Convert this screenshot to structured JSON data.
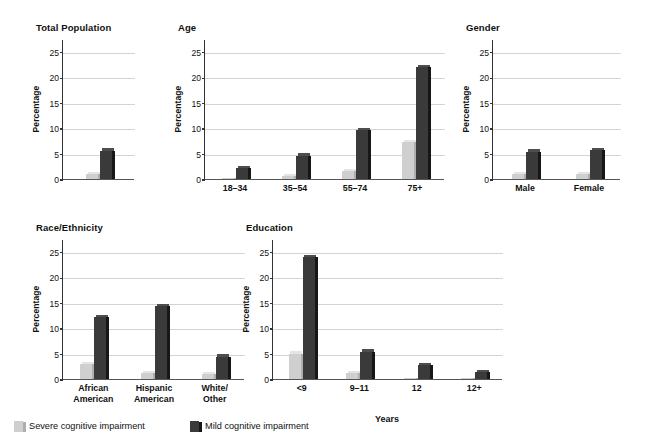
{
  "figure": {
    "ylabel": "Percentage",
    "yticks": [
      0,
      5,
      10,
      15,
      20,
      25
    ],
    "ymax": 27.5,
    "colors": {
      "severe": "#cfcfcf",
      "severe_side": "#aeaeae",
      "severe_top": "#e4e4e4",
      "mild": "#3a3a3a",
      "mild_side": "#171717",
      "mild_top": "#4e4e4e",
      "grid": "#d3d3d3",
      "axis": "#333333",
      "text": "#111111"
    }
  },
  "legend": {
    "position": "bottom-left",
    "items": [
      {
        "label": "Severe cognitive impairment",
        "key": "severe"
      },
      {
        "label": "Mild cognitive impairment",
        "key": "mild"
      }
    ]
  },
  "chart_data": [
    {
      "type": "bar",
      "title": "Total Population",
      "xlabel": "",
      "ylabel": "Percentage",
      "ylim": [
        0,
        27.5
      ],
      "yticks": [
        0,
        5,
        10,
        15,
        20,
        25
      ],
      "grid": true,
      "categories": [
        "Total Population"
      ],
      "series": [
        {
          "name": "Severe cognitive impairment",
          "values": [
            1.0
          ]
        },
        {
          "name": "Mild cognitive impairment",
          "values": [
            5.6
          ]
        }
      ]
    },
    {
      "type": "bar",
      "title": "Age",
      "xlabel": "",
      "ylabel": "Percentage",
      "ylim": [
        0,
        27.5
      ],
      "yticks": [
        0,
        5,
        10,
        15,
        20,
        25
      ],
      "grid": true,
      "categories": [
        "18–34",
        "35–54",
        "55–74",
        "75+"
      ],
      "series": [
        {
          "name": "Severe cognitive impairment",
          "values": [
            0.2,
            0.6,
            1.6,
            7.2
          ]
        },
        {
          "name": "Mild cognitive impairment",
          "values": [
            2.2,
            4.6,
            9.6,
            22.0
          ]
        }
      ]
    },
    {
      "type": "bar",
      "title": "Gender",
      "xlabel": "",
      "ylabel": "Percentage",
      "ylim": [
        0,
        27.5
      ],
      "yticks": [
        0,
        5,
        10,
        15,
        20,
        25
      ],
      "grid": true,
      "categories": [
        "Male",
        "Female"
      ],
      "series": [
        {
          "name": "Severe cognitive impairment",
          "values": [
            1.0,
            1.0
          ]
        },
        {
          "name": "Mild cognitive impairment",
          "values": [
            5.4,
            5.7
          ]
        }
      ]
    },
    {
      "type": "bar",
      "title": "Race/Ethnicity",
      "xlabel": "",
      "ylabel": "Percentage",
      "ylim": [
        0,
        27.5
      ],
      "yticks": [
        0,
        5,
        10,
        15,
        20,
        25
      ],
      "grid": true,
      "categories": [
        "African\nAmerican",
        "Hispanic\nAmerican",
        "White/\nOther"
      ],
      "series": [
        {
          "name": "Severe cognitive impairment",
          "values": [
            2.9,
            1.2,
            0.9
          ]
        },
        {
          "name": "Mild cognitive impairment",
          "values": [
            12.2,
            14.3,
            4.4
          ]
        }
      ]
    },
    {
      "type": "bar",
      "title": "Education",
      "xlabel": "Years",
      "ylabel": "Percentage",
      "ylim": [
        0,
        27.5
      ],
      "yticks": [
        0,
        5,
        10,
        15,
        20,
        25
      ],
      "grid": true,
      "categories": [
        "<9",
        "9–11",
        "12",
        "12+"
      ],
      "series": [
        {
          "name": "Severe cognitive impairment",
          "values": [
            5.0,
            1.1,
            0.1,
            0.1
          ]
        },
        {
          "name": "Mild cognitive impairment",
          "values": [
            24.0,
            5.4,
            2.8,
            1.3
          ]
        }
      ]
    }
  ],
  "layout": {
    "panels": [
      {
        "index": 0,
        "x": 36,
        "y": 22,
        "plot_w": 72,
        "plot_h": 140,
        "plot_left": 62,
        "title_x": 0,
        "bar_w": 12,
        "pair_gap": 2,
        "inner_pad": 0.3
      },
      {
        "index": 1,
        "x": 178,
        "y": 22,
        "plot_w": 240,
        "plot_h": 140,
        "plot_left": 204,
        "title_x": 0,
        "bar_w": 12,
        "pair_gap": 2,
        "inner_pad": 0.24
      },
      {
        "index": 2,
        "x": 466,
        "y": 22,
        "plot_w": 128,
        "plot_h": 140,
        "plot_left": 492,
        "title_x": 0,
        "bar_w": 12,
        "pair_gap": 2,
        "inner_pad": 0.26
      },
      {
        "index": 3,
        "x": 36,
        "y": 222,
        "plot_w": 182,
        "plot_h": 140,
        "plot_left": 62,
        "title_x": 0,
        "bar_w": 12,
        "pair_gap": 2,
        "inner_pad": 0.24
      },
      {
        "index": 4,
        "x": 246,
        "y": 222,
        "plot_w": 230,
        "plot_h": 140,
        "plot_left": 272,
        "title_x": 0,
        "bar_w": 12,
        "pair_gap": 2,
        "inner_pad": 0.24
      }
    ],
    "legend_items_x": [
      0,
      176
    ]
  }
}
